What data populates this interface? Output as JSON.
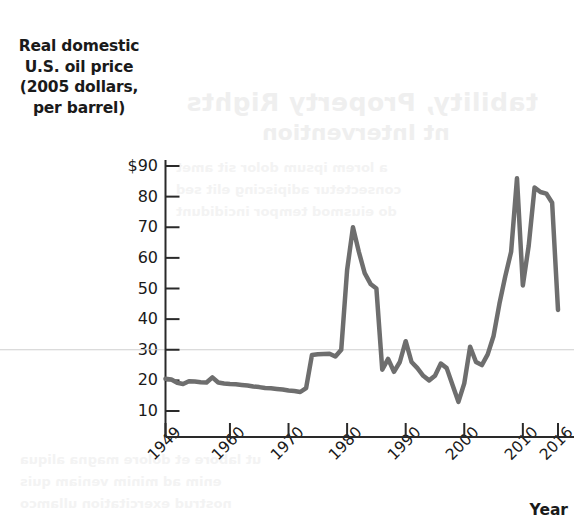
{
  "axis_titles": {
    "y_lines": [
      "Real domestic",
      "U.S. oil price",
      "(2005 dollars,",
      "per barrel)"
    ],
    "x": "Year"
  },
  "bleed_text": {
    "line1": "tability, Property Rights",
    "line2": "nt Intervention",
    "line3": "a lorem ipsum dolor sit amet",
    "line4": "consectetur adipiscing elit sed",
    "line5": "do eiusmod tempor incididunt",
    "line6": "ut labore et dolore magna aliqua",
    "line7": "enim ad minim veniam quis",
    "line8": "nostrud exercitation ullamco"
  },
  "chart_data": {
    "type": "line",
    "title": "",
    "xlabel": "Year",
    "ylabel": "Real domestic U.S. oil price (2005 dollars, per barrel)",
    "xlim": [
      1949,
      2016
    ],
    "ylim": [
      0,
      95
    ],
    "yticks": [
      10,
      20,
      30,
      40,
      50,
      60,
      70,
      80,
      90
    ],
    "ytick_labels": [
      "10",
      "20",
      "30",
      "40",
      "50",
      "60",
      "70",
      "80",
      "$90"
    ],
    "xticks": [
      1949,
      1960,
      1970,
      1980,
      1990,
      2000,
      2010,
      2016
    ],
    "xtick_labels": [
      "1949",
      "1960",
      "1970",
      "1980",
      "1990",
      "2000",
      "2010",
      "2016"
    ],
    "grid": "single horizontal gridline at y=30",
    "gridline_value": 30,
    "legend": "none",
    "line_color": "#6e6e6e",
    "line_width": 4.5,
    "x": [
      1949,
      1950,
      1951,
      1952,
      1953,
      1954,
      1955,
      1956,
      1957,
      1958,
      1959,
      1960,
      1961,
      1962,
      1963,
      1964,
      1965,
      1966,
      1967,
      1968,
      1969,
      1970,
      1971,
      1972,
      1973,
      1974,
      1975,
      1976,
      1977,
      1978,
      1979,
      1980,
      1981,
      1982,
      1983,
      1984,
      1985,
      1986,
      1987,
      1988,
      1989,
      1990,
      1991,
      1992,
      1993,
      1994,
      1995,
      1996,
      1997,
      1998,
      1999,
      2000,
      2001,
      2002,
      2003,
      2004,
      2005,
      2006,
      2007,
      2008,
      2009,
      2010,
      2011,
      2012,
      2013,
      2014,
      2015,
      2016
    ],
    "y": [
      20.5,
      20.3,
      19.2,
      18.8,
      19.7,
      19.6,
      19.4,
      19.3,
      21.0,
      19.3,
      19.0,
      18.8,
      18.7,
      18.5,
      18.3,
      18.0,
      17.8,
      17.5,
      17.4,
      17.2,
      17.0,
      16.7,
      16.5,
      16.2,
      17.5,
      28.3,
      28.5,
      28.6,
      28.7,
      27.8,
      30.0,
      56.0,
      70.0,
      62.0,
      55.0,
      51.5,
      50.0,
      23.5,
      27.0,
      22.8,
      26.0,
      32.8,
      26.0,
      24.0,
      21.5,
      20.0,
      21.5,
      25.5,
      24.0,
      18.5,
      13.0,
      19.0,
      31.0,
      26.0,
      25.0,
      28.5,
      34.5,
      45.0,
      54.0,
      62.0,
      86.0,
      51.0,
      64.0,
      83.0,
      81.5,
      81.0,
      78.0,
      43.0,
      31.0
    ],
    "annotations": [
      {
        "label": "1973-74 OPEC embargo step",
        "year": 1974,
        "value": 28.3
      },
      {
        "label": "1981 peak",
        "year": 1981,
        "value": 70.0
      },
      {
        "label": "1986 price collapse",
        "year": 1986,
        "value": 23.5
      },
      {
        "label": "1998 trough",
        "year": 1998,
        "value": 13.0
      },
      {
        "label": "2008 peak",
        "year": 2008,
        "value": 86.0
      },
      {
        "label": "2009 crash",
        "year": 2009,
        "value": 51.0
      },
      {
        "label": "2012 secondary peak",
        "year": 2012,
        "value": 83.0
      },
      {
        "label": "2016 end",
        "year": 2016,
        "value": 31.0
      }
    ]
  }
}
